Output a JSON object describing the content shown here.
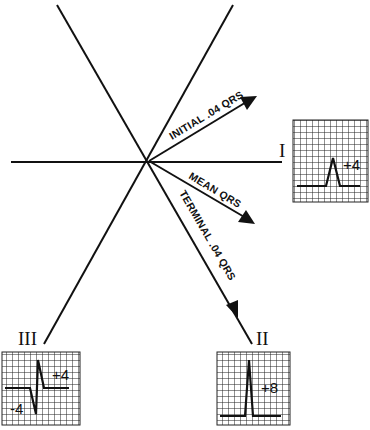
{
  "diagram": {
    "vectors": {
      "initial": "INITIAL .04 QRS",
      "mean": "MEAN  QRS",
      "terminal": "TERMINAL .04 QRS"
    },
    "leads": [
      {
        "name": "I",
        "value": "+4"
      },
      {
        "name": "II",
        "value": "+8"
      },
      {
        "name": "III",
        "positive": "+4",
        "negative": "-4"
      }
    ]
  }
}
